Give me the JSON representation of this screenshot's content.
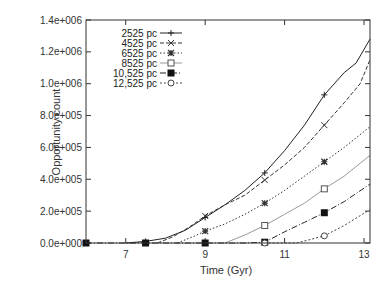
{
  "chart_data": {
    "type": "line",
    "title": "",
    "xlabel": "Time (Gyr)",
    "ylabel": "Opportunity count",
    "xlim": [
      6.0,
      13.15
    ],
    "ylim": [
      0,
      1400000
    ],
    "xticks": [
      7,
      9,
      11,
      13
    ],
    "xtick_labels": [
      "7",
      "9",
      "11",
      "13"
    ],
    "yticks": [
      0,
      200000,
      400000,
      600000,
      800000,
      1000000,
      1200000,
      1400000
    ],
    "ytick_labels": [
      "0.0e+000",
      "2.0e+005",
      "4.0e+005",
      "6.0e+005",
      "8.0e+005",
      "1.0e+006",
      "1.2e+006",
      "1.4e+006"
    ],
    "grid": false,
    "legend_position": "upper-left-inside",
    "marker_x": [
      6.0,
      7.5,
      9.0,
      10.5,
      12.0
    ],
    "series": [
      {
        "name": "2525 pc",
        "marker": "plus",
        "dash": "solid",
        "color": "#222222",
        "x": [
          7.0,
          7.5,
          8.0,
          8.5,
          9.0,
          9.5,
          10.0,
          10.5,
          11.0,
          11.5,
          12.0,
          12.5,
          12.8,
          13.15
        ],
        "y": [
          0,
          10000,
          30000,
          80000,
          160000,
          240000,
          330000,
          440000,
          580000,
          740000,
          930000,
          1070000,
          1130000,
          1280000
        ]
      },
      {
        "name": "4525 pc",
        "marker": "cross",
        "dash": "4,2",
        "color": "#333333",
        "x": [
          7.8,
          8.2,
          8.6,
          9.0,
          9.5,
          10.0,
          10.5,
          11.0,
          11.5,
          12.0,
          12.5,
          12.9,
          13.15
        ],
        "y": [
          0,
          40000,
          100000,
          170000,
          240000,
          300000,
          395000,
          490000,
          600000,
          740000,
          880000,
          1000000,
          1150000
        ]
      },
      {
        "name": "6525 pc",
        "marker": "star",
        "dash": "1.5,2",
        "color": "#333333",
        "x": [
          8.3,
          8.7,
          9.0,
          9.5,
          10.0,
          10.5,
          11.0,
          11.5,
          12.0,
          12.5,
          13.15
        ],
        "y": [
          0,
          40000,
          75000,
          120000,
          180000,
          250000,
          330000,
          420000,
          510000,
          600000,
          730000
        ]
      },
      {
        "name": "8525 pc",
        "marker": "open-square",
        "dash": "solid",
        "color": "#999999",
        "x": [
          9.5,
          10.0,
          10.5,
          11.0,
          11.5,
          12.0,
          12.5,
          13.15
        ],
        "y": [
          0,
          50000,
          110000,
          180000,
          250000,
          340000,
          420000,
          550000
        ]
      },
      {
        "name": "10,525 pc",
        "marker": "filled-square",
        "dash": "6,2,1,2",
        "color": "#222222",
        "x": [
          6.0,
          7.5,
          9.0,
          10.0,
          10.5,
          11.0,
          11.5,
          12.0,
          12.5,
          13.15
        ],
        "y": [
          0,
          0,
          0,
          0,
          5000,
          70000,
          130000,
          190000,
          260000,
          370000
        ]
      },
      {
        "name": "12,525 pc",
        "marker": "open-circle",
        "dash": "2,2",
        "color": "#444444",
        "x": [
          10.5,
          11.3,
          11.7,
          12.0,
          12.5,
          13.15
        ],
        "y": [
          0,
          0,
          25000,
          45000,
          110000,
          210000
        ]
      }
    ]
  }
}
